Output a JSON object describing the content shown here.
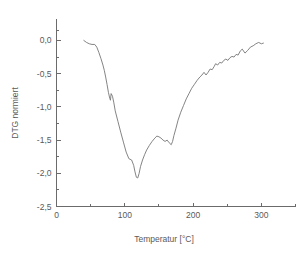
{
  "chart_data": {
    "type": "line",
    "title": "",
    "xlabel": "Temperatur [°C]",
    "ylabel": "DTG normiert",
    "xlim": [
      0,
      350
    ],
    "ylim": [
      -2.5,
      0.15
    ],
    "grid": false,
    "legend": null,
    "x_ticks_major": [
      0,
      100,
      200,
      300
    ],
    "x_tick_labels": [
      "0",
      "100",
      "200",
      "300"
    ],
    "x_ticks_minor": [
      50,
      150,
      250,
      350
    ],
    "y_ticks_major": [
      0.0,
      -0.5,
      -1.0,
      -1.5,
      -2.0,
      -2.5
    ],
    "y_tick_labels": [
      "0,0",
      "-0,5",
      "-1,0",
      "-1,5",
      "-2,0",
      "-2,5"
    ],
    "y_ticks_minor": [
      0.15,
      -0.25,
      -0.75,
      -1.25,
      -1.75,
      -2.25
    ],
    "line_color": "#767676",
    "axis_color": "#6b6b6b",
    "background_color": "#ffffff",
    "series": [
      {
        "name": "DTG normiert",
        "x": [
          40,
          44,
          48,
          52,
          56,
          59,
          62,
          65,
          68,
          70,
          72,
          74,
          76,
          78,
          79,
          80,
          82,
          84,
          86,
          90,
          94,
          98,
          102,
          106,
          110,
          113,
          115,
          117,
          119,
          121,
          123,
          126,
          129,
          132,
          136,
          140,
          144,
          147,
          150,
          153,
          156,
          159,
          162,
          165,
          168,
          170,
          172,
          175,
          178,
          182,
          186,
          190,
          194,
          198,
          202,
          206,
          210,
          213,
          216,
          219,
          222,
          225,
          228,
          231,
          233,
          236,
          239,
          242,
          245,
          248,
          251,
          254,
          257,
          260,
          263,
          266,
          269,
          272,
          276,
          280,
          284,
          288,
          292,
          296,
          300,
          303
        ],
        "y": [
          0.0,
          -0.03,
          -0.05,
          -0.06,
          -0.06,
          -0.1,
          -0.18,
          -0.27,
          -0.37,
          -0.45,
          -0.55,
          -0.66,
          -0.78,
          -0.87,
          -0.9,
          -0.8,
          -0.84,
          -0.94,
          -1.06,
          -1.22,
          -1.38,
          -1.53,
          -1.68,
          -1.78,
          -1.8,
          -1.88,
          -1.98,
          -2.06,
          -2.07,
          -2.0,
          -1.9,
          -1.8,
          -1.72,
          -1.65,
          -1.58,
          -1.52,
          -1.47,
          -1.44,
          -1.45,
          -1.47,
          -1.5,
          -1.52,
          -1.5,
          -1.54,
          -1.57,
          -1.52,
          -1.43,
          -1.32,
          -1.2,
          -1.08,
          -0.98,
          -0.88,
          -0.8,
          -0.72,
          -0.66,
          -0.6,
          -0.55,
          -0.52,
          -0.48,
          -0.52,
          -0.48,
          -0.43,
          -0.44,
          -0.39,
          -0.35,
          -0.37,
          -0.33,
          -0.34,
          -0.3,
          -0.28,
          -0.3,
          -0.26,
          -0.24,
          -0.25,
          -0.21,
          -0.22,
          -0.16,
          -0.13,
          -0.19,
          -0.15,
          -0.1,
          -0.08,
          -0.05,
          -0.03,
          -0.05,
          -0.04
        ]
      }
    ]
  }
}
